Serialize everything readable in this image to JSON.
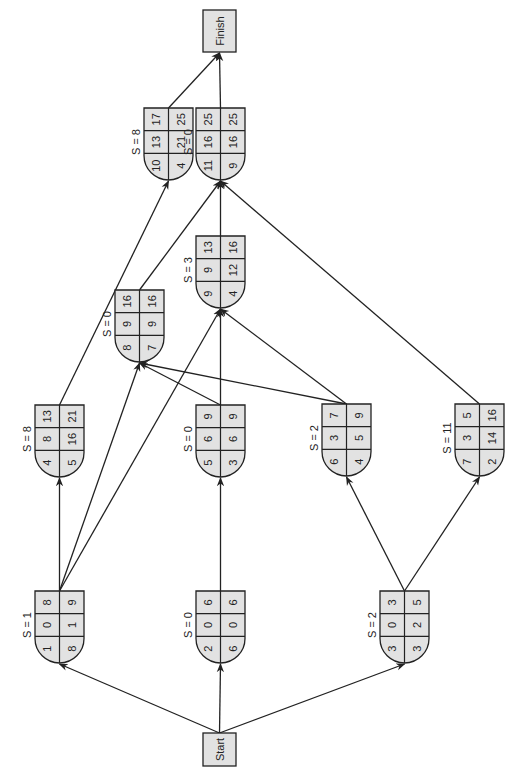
{
  "diagram": {
    "type": "activity-on-node network (rotated 90° counter-clockwise)",
    "colors": {
      "node_fill": "#e2e2e2",
      "stroke": "#222222",
      "background": "#ffffff",
      "text": "#222222"
    },
    "terminals": [
      {
        "id": "start",
        "label": "Start",
        "x": 203,
        "y": 733,
        "w": 33,
        "h": 33
      },
      {
        "id": "finish",
        "label": "Finish",
        "x": 203,
        "y": 10,
        "w": 33,
        "h": 42
      }
    ],
    "nodes": [
      {
        "id": "n1",
        "slack": "S = 1",
        "x": 35,
        "y": 591,
        "grid": [
          [
            "1",
            "0",
            "8"
          ],
          [
            "8",
            "1",
            "9"
          ]
        ]
      },
      {
        "id": "n2",
        "slack": "S = 0",
        "x": 196,
        "y": 591,
        "grid": [
          [
            "2",
            "0",
            "6"
          ],
          [
            "6",
            "0",
            "6"
          ]
        ]
      },
      {
        "id": "n3",
        "slack": "S = 2",
        "x": 380,
        "y": 591,
        "grid": [
          [
            "3",
            "0",
            "3"
          ],
          [
            "3",
            "2",
            "5"
          ]
        ]
      },
      {
        "id": "n4",
        "slack": "S = 8",
        "x": 35,
        "y": 405,
        "grid": [
          [
            "4",
            "8",
            "13"
          ],
          [
            "5",
            "16",
            "21"
          ]
        ]
      },
      {
        "id": "n5",
        "slack": "S = 0",
        "x": 196,
        "y": 405,
        "grid": [
          [
            "5",
            "6",
            "9"
          ],
          [
            "3",
            "6",
            "9"
          ]
        ]
      },
      {
        "id": "n6",
        "slack": "S = 2",
        "x": 322,
        "y": 404,
        "grid": [
          [
            "6",
            "3",
            "7"
          ],
          [
            "4",
            "5",
            "9"
          ]
        ]
      },
      {
        "id": "n7",
        "slack": "S = 11",
        "x": 455,
        "y": 404,
        "grid": [
          [
            "7",
            "3",
            "5"
          ],
          [
            "2",
            "14",
            "16"
          ]
        ]
      },
      {
        "id": "n8",
        "slack": "S = 0",
        "x": 115,
        "y": 290,
        "grid": [
          [
            "8",
            "9",
            "16"
          ],
          [
            "7",
            "9",
            "16"
          ]
        ]
      },
      {
        "id": "n9",
        "slack": "S = 3",
        "x": 196,
        "y": 236,
        "grid": [
          [
            "9",
            "9",
            "13"
          ],
          [
            "4",
            "12",
            "16"
          ]
        ]
      },
      {
        "id": "n10",
        "slack": "S = 8",
        "x": 144,
        "y": 108,
        "grid": [
          [
            "10",
            "13",
            "17"
          ],
          [
            "4",
            "21",
            "25"
          ]
        ]
      },
      {
        "id": "n11",
        "slack": "S = 0",
        "x": 196,
        "y": 108,
        "grid": [
          [
            "11",
            "16",
            "25"
          ],
          [
            "9",
            "16",
            "25"
          ]
        ]
      }
    ],
    "edges": [
      {
        "from": "start",
        "to": "n1"
      },
      {
        "from": "start",
        "to": "n2"
      },
      {
        "from": "start",
        "to": "n3"
      },
      {
        "from": "n1",
        "to": "n4"
      },
      {
        "from": "n1",
        "to": "n8"
      },
      {
        "from": "n1",
        "to": "n9"
      },
      {
        "from": "n2",
        "to": "n5"
      },
      {
        "from": "n3",
        "to": "n6"
      },
      {
        "from": "n3",
        "to": "n7"
      },
      {
        "from": "n4",
        "to": "n10"
      },
      {
        "from": "n5",
        "to": "n8"
      },
      {
        "from": "n5",
        "to": "n9"
      },
      {
        "from": "n6",
        "to": "n8"
      },
      {
        "from": "n6",
        "to": "n9"
      },
      {
        "from": "n7",
        "to": "n11"
      },
      {
        "from": "n8",
        "to": "n11"
      },
      {
        "from": "n9",
        "to": "n11"
      },
      {
        "from": "n10",
        "to": "finish"
      },
      {
        "from": "n11",
        "to": "finish"
      }
    ],
    "legend_note": "Each node (read upright): top row = activity no. | ES | EF; bottom row = duration | LS | LF; S = slack"
  }
}
